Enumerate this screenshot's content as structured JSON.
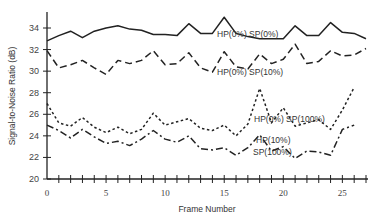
{
  "chart_data": {
    "type": "line",
    "title": "",
    "xlabel": "Frame Number",
    "ylabel": "Signal-to-Noise Ratio (dB)",
    "xlim": [
      0,
      27
    ],
    "ylim": [
      20,
      35
    ],
    "grid": false,
    "legend": "inline labels",
    "x_ticks": [
      0,
      5,
      10,
      15,
      20,
      25
    ],
    "y_ticks": [
      20,
      22,
      24,
      26,
      28,
      30,
      32,
      34
    ],
    "x": [
      0,
      1,
      2,
      3,
      4,
      5,
      6,
      7,
      8,
      9,
      10,
      11,
      12,
      13,
      14,
      15,
      16,
      17,
      18,
      19,
      20,
      21,
      22,
      23,
      24,
      25,
      26,
      27
    ],
    "series": [
      {
        "name": "HP(0%) SP(0%)",
        "style": "solid",
        "values": [
          32.8,
          33.3,
          33.7,
          33.1,
          33.7,
          34.0,
          34.2,
          33.9,
          33.8,
          33.4,
          33.4,
          33.3,
          34.4,
          33.5,
          33.5,
          35.0,
          33.5,
          33.2,
          33.0,
          33.0,
          33.0,
          34.2,
          33.3,
          33.3,
          34.5,
          33.6,
          33.5,
          33.0
        ],
        "label_pos": {
          "x": 15.6,
          "y": 33.7
        }
      },
      {
        "name": "HP(0%) SP(10%)",
        "style": "dashed",
        "values": [
          31.9,
          30.3,
          30.6,
          31.0,
          30.3,
          29.7,
          31.0,
          30.7,
          31.0,
          31.9,
          30.6,
          30.7,
          31.7,
          30.3,
          29.9,
          31.8,
          30.4,
          30.2,
          31.6,
          30.7,
          31.1,
          32.5,
          30.7,
          30.9,
          31.9,
          31.4,
          31.5,
          32.1
        ],
        "label_pos": {
          "x": 15.6,
          "y": 30.2
        }
      },
      {
        "name": "HP(0%) SP(100%)",
        "style": "dotted",
        "values": [
          27.0,
          25.2,
          24.9,
          25.7,
          24.8,
          24.3,
          24.8,
          24.2,
          24.6,
          26.1,
          25.0,
          25.3,
          25.6,
          24.7,
          24.5,
          25.0,
          24.0,
          25.1,
          28.4,
          25.2,
          26.6,
          24.9,
          25.2,
          25.5,
          24.6,
          26.4,
          28.5,
          0
        ],
        "label_pos": {
          "x": 19.0,
          "y": 25.6
        }
      },
      {
        "name": "HP(10%) SP(100%)",
        "style": "dashdot",
        "values": [
          25.0,
          24.5,
          23.8,
          24.6,
          23.9,
          23.3,
          23.5,
          23.1,
          23.7,
          24.5,
          23.7,
          23.4,
          24.0,
          22.8,
          22.7,
          22.9,
          22.2,
          22.9,
          24.1,
          22.6,
          23.0,
          21.9,
          22.6,
          22.5,
          22.2,
          24.6,
          25.0,
          0
        ],
        "label_pos": {
          "x": 18.6,
          "y": 23.0
        }
      }
    ]
  },
  "labels": {
    "xlabel": "Frame Number",
    "ylabel": "Signal-to-Noise Ratio (dB)",
    "series_0": "HP(0%) SP(0%)",
    "series_1": "HP(0%) SP(10%)",
    "series_2": "HP(0%) SP(100%)",
    "series_3a": "HP(10%)",
    "series_3b": "SP(100%)"
  }
}
